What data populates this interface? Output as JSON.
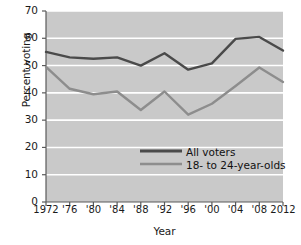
{
  "chart_data": {
    "type": "line",
    "title": "",
    "xlabel": "Year",
    "ylabel": "Percent voting",
    "x": [
      1972,
      1976,
      1980,
      1984,
      1988,
      1992,
      1996,
      2000,
      2004,
      2008,
      2012
    ],
    "xtick_labels": [
      "1972",
      "'76",
      "'80",
      "'84",
      "'88",
      "'92",
      "'96",
      "'00",
      "'04",
      "'08",
      "2012"
    ],
    "ytick_labels": [
      "0",
      "10",
      "20",
      "30",
      "40",
      "50",
      "60",
      "70"
    ],
    "yticks": [
      0,
      10,
      20,
      30,
      40,
      50,
      60,
      70
    ],
    "ylim": [
      0,
      70
    ],
    "xlim": [
      1972,
      2012
    ],
    "grid": "horizontal-white",
    "legend_position": "center-right-inside",
    "plot_background": "#c9c9c9",
    "series": [
      {
        "name": "All voters",
        "color": "#4a4a4a",
        "values": [
          55.0,
          53.0,
          52.5,
          53.0,
          50.0,
          54.5,
          48.5,
          50.8,
          59.8,
          60.5,
          55.5
        ]
      },
      {
        "name": "18- to 24-year-olds",
        "color": "#8d8d8d",
        "values": [
          49.5,
          41.5,
          39.5,
          40.5,
          33.7,
          40.5,
          32.0,
          36.0,
          42.5,
          49.3,
          44.0
        ]
      }
    ]
  }
}
